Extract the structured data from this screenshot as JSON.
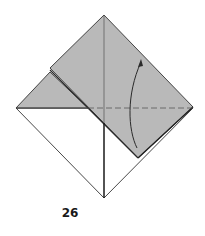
{
  "diagram": {
    "type": "origami-fold-step",
    "step_number": "26",
    "colors": {
      "paper_colored_side": "#b9b9b9",
      "paper_white_side": "#ffffff",
      "line": "#333333",
      "arrow": "#2a2a2a"
    },
    "elements": {
      "base_square": "diamond base with white lower half",
      "back_layer": "gray upper-left triangle",
      "front_flap": "gray folded flap covering upper-right",
      "center_crease": "vertical crease line",
      "horizontal_crease": "dashed valley fold line",
      "fold_arrow": "curved arrow pointing upward"
    }
  }
}
